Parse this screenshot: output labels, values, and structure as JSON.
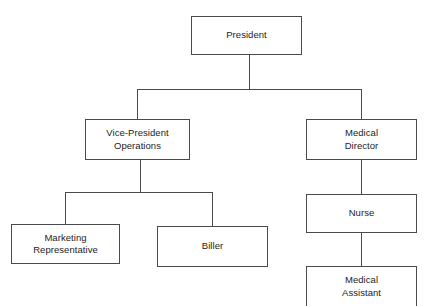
{
  "chart": {
    "type": "org-chart",
    "box_border_color": "#4a4a4a",
    "box_fill_color": "#ffffff",
    "text_color": "#1c1c1c",
    "background_color": "#ffffff",
    "nodes": {
      "president": {
        "label": "President",
        "level": 1
      },
      "vice_president_operations": {
        "label": "Vice-President\nOperations",
        "level": 2
      },
      "medical_director": {
        "label": "Medical\nDirector",
        "level": 2
      },
      "marketing_representative": {
        "label": "Marketing\nRepresentative",
        "level": 3
      },
      "biller": {
        "label": "Biller",
        "level": 3
      },
      "nurse": {
        "label": "Nurse",
        "level": 3
      },
      "medical_assistant": {
        "label": "Medical\nAssistant",
        "level": 4
      }
    },
    "edges": [
      {
        "from": "president",
        "to": "vice_president_operations"
      },
      {
        "from": "president",
        "to": "medical_director"
      },
      {
        "from": "vice_president_operations",
        "to": "marketing_representative"
      },
      {
        "from": "vice_president_operations",
        "to": "biller"
      },
      {
        "from": "medical_director",
        "to": "nurse"
      },
      {
        "from": "nurse",
        "to": "medical_assistant"
      }
    ]
  }
}
